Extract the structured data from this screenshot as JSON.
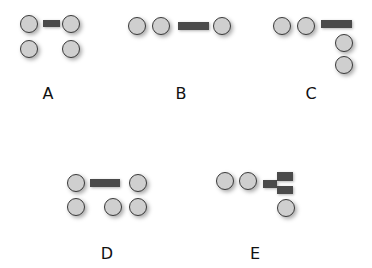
{
  "figure": {
    "options": [
      {
        "label": "A",
        "circles": 4,
        "bars": 1
      },
      {
        "label": "B",
        "circles": 3,
        "bars": 1
      },
      {
        "label": "C",
        "circles": 4,
        "bars": 1
      },
      {
        "label": "D",
        "circles": 5,
        "bars": 1
      },
      {
        "label": "E",
        "circles": 3,
        "bars": 3
      }
    ]
  },
  "colors": {
    "circle_fill": "#cfcfcf",
    "circle_stroke": "#3a3a3a",
    "bar_fill": "#4a4a4a",
    "background": "#ffffff"
  }
}
